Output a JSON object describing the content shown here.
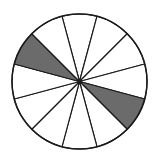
{
  "figure": {
    "name": "fraction-circle-model",
    "shape": "circle",
    "total_sectors": 12,
    "shaded_sectors": 2,
    "unshaded_sectors": 10,
    "sector_angle_degrees": 30,
    "fraction_shaded": "2/12",
    "fraction_shaded_simplified": "1/6",
    "percent_shaded": 16.7
  },
  "geometry": {
    "center_x": 79.5,
    "center_y": 81.5,
    "radius": 67.5,
    "start_angle_degrees": -105,
    "canvas_width": 160,
    "canvas_height": 167
  },
  "colors": {
    "shaded_fill": "#6b6b6b",
    "unshaded_fill": "#ffffff",
    "outline": "#1a1a1a",
    "background": "#ffffff"
  },
  "chart_data": {
    "type": "pie",
    "title": "",
    "categories": [
      "sector-1",
      "sector-2",
      "sector-3",
      "sector-4",
      "sector-5",
      "sector-6",
      "sector-7",
      "sector-8",
      "sector-9",
      "sector-10",
      "sector-11",
      "sector-12"
    ],
    "values": [
      1,
      1,
      1,
      1,
      1,
      1,
      1,
      1,
      1,
      1,
      1,
      1
    ],
    "slice_angles_degrees": [
      30,
      30,
      30,
      30,
      30,
      30,
      30,
      30,
      30,
      30,
      30,
      30
    ],
    "slice_states": [
      "unshaded",
      "unshaded",
      "unshaded",
      "unshaded",
      "shaded",
      "unshaded",
      "unshaded",
      "unshaded",
      "unshaded",
      "unshaded",
      "shaded",
      "unshaded"
    ],
    "shaded_indices": [
      4,
      10
    ],
    "legend": [],
    "legend_position": "none",
    "grid": false,
    "xlabel": "",
    "ylabel": ""
  }
}
